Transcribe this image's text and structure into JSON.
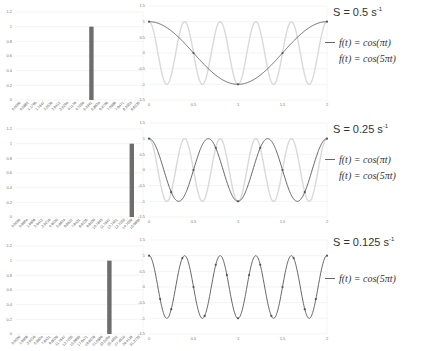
{
  "panels": [
    {
      "sampling_rate_label": "S = 0.5 s",
      "sampling_rate_unit_exp": "-1",
      "legend": [
        {
          "label": "f(t) = cos(πt)",
          "style": "dark"
        },
        {
          "label": "f(t) = cos(5πt)",
          "style": "light"
        }
      ]
    },
    {
      "sampling_rate_label": "S = 0.25 s",
      "sampling_rate_unit_exp": "-1",
      "legend": [
        {
          "label": "f(t) = cos(πt)",
          "style": "dark"
        },
        {
          "label": "f(t) = cos(5πt)",
          "style": "light"
        }
      ]
    },
    {
      "sampling_rate_label": "S = 0.125 s",
      "sampling_rate_unit_exp": "-1",
      "legend": [
        {
          "label": "f(t) = cos(5πt)",
          "style": "dark"
        }
      ]
    }
  ],
  "chart_data": [
    {
      "type": "bar",
      "title": "",
      "xlabel": "",
      "ylabel": "",
      "ylim": [
        0,
        1.2
      ],
      "yticks": [
        "0",
        "0.2",
        "0.4",
        "0.6",
        "0.8",
        "1",
        "1.2"
      ],
      "categories": [
        "0.0000",
        "0.5882",
        "1.1765",
        "1.7647",
        "2.3529",
        "2.9412",
        "3.5294",
        "4.1176",
        "4.7059",
        "5.2941",
        "5.8824",
        "6.4706",
        "7.0588",
        "7.6471",
        "8.2353",
        "8.8235"
      ],
      "values": [
        0,
        0,
        0,
        0,
        0,
        0,
        0,
        0,
        0,
        1,
        0,
        0,
        0,
        0,
        0,
        0
      ],
      "grid": true
    },
    {
      "type": "line",
      "title": "",
      "xlabel": "",
      "ylabel": "",
      "xlim": [
        0,
        2
      ],
      "ylim": [
        -1.5,
        1.5
      ],
      "xticks": [
        "0",
        "0.5",
        "1",
        "1.5",
        "2"
      ],
      "yticks": [
        "1.5",
        "1",
        "0.5",
        "0",
        "-0.5",
        "-1",
        "-1.5"
      ],
      "series": [
        {
          "name": "f(t) = cos(πt)",
          "color": "#555555",
          "freq_pi_multiple": 1,
          "sample_points_t": [
            0,
            0.5,
            1,
            1.5,
            2
          ]
        },
        {
          "name": "f(t) = cos(5πt)",
          "color": "#d9d9d9",
          "freq_pi_multiple": 5
        }
      ],
      "grid": true
    },
    {
      "type": "bar",
      "title": "",
      "xlabel": "",
      "ylabel": "",
      "ylim": [
        0,
        1.2
      ],
      "yticks": [
        "0",
        "0.2",
        "0.4",
        "0.6",
        "0.8",
        "1",
        "1.2"
      ],
      "categories": [
        "0.0000",
        "0.9804",
        "1.9608",
        "2.9412",
        "3.9216",
        "4.9020",
        "5.8824",
        "6.8627",
        "7.8431",
        "8.8235",
        "9.8039",
        "10.7843",
        "11.7647",
        "12.7451",
        "13.7255",
        "14.7059",
        "15.6863"
      ],
      "values": [
        0,
        0,
        0,
        0,
        0,
        0,
        0,
        0,
        0,
        0,
        0,
        0,
        0,
        0,
        0,
        1,
        0
      ],
      "grid": true
    },
    {
      "type": "line",
      "title": "",
      "xlabel": "",
      "ylabel": "",
      "xlim": [
        0,
        2
      ],
      "ylim": [
        -1.5,
        1.5
      ],
      "xticks": [
        "0",
        "0.5",
        "1",
        "1.5",
        "2"
      ],
      "yticks": [
        "1.5",
        "1",
        "0.5",
        "0",
        "-0.5",
        "-1",
        "-1.5"
      ],
      "series": [
        {
          "name": "f(t) = cos(πt)",
          "color": "#555555",
          "freq_pi_multiple": 3,
          "sample_points_t": [
            0,
            0.25,
            0.5,
            0.75,
            1,
            1.25,
            1.5,
            1.75,
            2
          ]
        },
        {
          "name": "f(t) = cos(5πt)",
          "color": "#d9d9d9",
          "freq_pi_multiple": 5
        }
      ],
      "grid": true
    },
    {
      "type": "bar",
      "title": "",
      "xlabel": "",
      "ylabel": "",
      "ylim": [
        0,
        1.2
      ],
      "yticks": [
        "0",
        "0.2",
        "0.4",
        "0.6",
        "0.8",
        "1",
        "1.2"
      ],
      "categories": [
        "0.0000",
        "1.9608",
        "3.9216",
        "5.8824",
        "7.8431",
        "9.8039",
        "11.7647",
        "13.7255",
        "15.6863",
        "17.6471",
        "19.6078",
        "21.5686",
        "23.5294",
        "25.4902",
        "27.4510",
        "29.4118",
        "31.3725"
      ],
      "values": [
        0,
        0,
        0,
        0,
        0,
        0,
        0,
        0,
        0,
        0,
        0,
        0,
        1,
        0,
        0,
        0,
        0
      ],
      "grid": true
    },
    {
      "type": "line",
      "title": "",
      "xlabel": "",
      "ylabel": "",
      "xlim": [
        0,
        2
      ],
      "ylim": [
        -1.5,
        1.5
      ],
      "xticks": [
        "0",
        "0.5",
        "1",
        "1.5",
        "2"
      ],
      "yticks": [
        "1.5",
        "1",
        "0.5",
        "0",
        "-0.5",
        "-1",
        "-1.5"
      ],
      "series": [
        {
          "name": "f(t) = cos(5πt)",
          "color": "#555555",
          "freq_pi_multiple": 5,
          "sample_points_t": [
            0,
            0.125,
            0.25,
            0.375,
            0.5,
            0.625,
            0.75,
            0.875,
            1,
            1.125,
            1.25,
            1.375,
            1.5,
            1.625,
            1.75,
            1.875,
            2
          ]
        }
      ],
      "grid": true
    }
  ]
}
